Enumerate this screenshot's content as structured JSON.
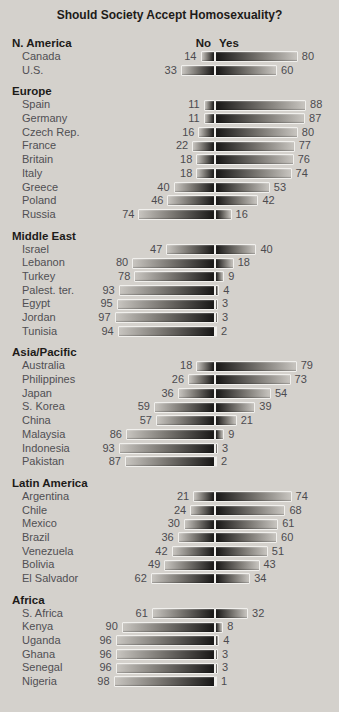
{
  "title": "Should Society Accept Homosexuality?",
  "columns": {
    "no": "No",
    "yes": "Yes"
  },
  "colors": {
    "background": "#d4d1cc",
    "bar_dark": "#181716",
    "bar_mid": "#7a7772",
    "bar_light": "#c8c5c0",
    "bar_border": "#f1f0ed",
    "heading_text": "#1d1b19",
    "label_text": "#504f53"
  },
  "chart_data": {
    "type": "bar",
    "subtype": "diverging-horizontal-paired",
    "title": "Should Society Accept Homosexuality?",
    "unit": "percent",
    "legend": [
      "No",
      "Yes"
    ],
    "legend_position": "top-center",
    "value_range": [
      0,
      100
    ],
    "grid": false,
    "groups": [
      {
        "region": "N. America",
        "rows": [
          {
            "country": "Canada",
            "no": 14,
            "yes": 80
          },
          {
            "country": "U.S.",
            "no": 33,
            "yes": 60
          }
        ]
      },
      {
        "region": "Europe",
        "rows": [
          {
            "country": "Spain",
            "no": 11,
            "yes": 88
          },
          {
            "country": "Germany",
            "no": 11,
            "yes": 87
          },
          {
            "country": "Czech Rep.",
            "no": 16,
            "yes": 80
          },
          {
            "country": "France",
            "no": 22,
            "yes": 77
          },
          {
            "country": "Britain",
            "no": 18,
            "yes": 76
          },
          {
            "country": "Italy",
            "no": 18,
            "yes": 74
          },
          {
            "country": "Greece",
            "no": 40,
            "yes": 53
          },
          {
            "country": "Poland",
            "no": 46,
            "yes": 42
          },
          {
            "country": "Russia",
            "no": 74,
            "yes": 16
          }
        ]
      },
      {
        "region": "Middle East",
        "rows": [
          {
            "country": "Israel",
            "no": 47,
            "yes": 40
          },
          {
            "country": "Lebanon",
            "no": 80,
            "yes": 18
          },
          {
            "country": "Turkey",
            "no": 78,
            "yes": 9
          },
          {
            "country": "Palest. ter.",
            "no": 93,
            "yes": 4
          },
          {
            "country": "Egypt",
            "no": 95,
            "yes": 3
          },
          {
            "country": "Jordan",
            "no": 97,
            "yes": 3
          },
          {
            "country": "Tunisia",
            "no": 94,
            "yes": 2
          }
        ]
      },
      {
        "region": "Asia/Pacific",
        "rows": [
          {
            "country": "Australia",
            "no": 18,
            "yes": 79
          },
          {
            "country": "Philippines",
            "no": 26,
            "yes": 73
          },
          {
            "country": "Japan",
            "no": 36,
            "yes": 54
          },
          {
            "country": "S. Korea",
            "no": 59,
            "yes": 39
          },
          {
            "country": "China",
            "no": 57,
            "yes": 21
          },
          {
            "country": "Malaysia",
            "no": 86,
            "yes": 9
          },
          {
            "country": "Indonesia",
            "no": 93,
            "yes": 3
          },
          {
            "country": "Pakistan",
            "no": 87,
            "yes": 2
          }
        ]
      },
      {
        "region": "Latin America",
        "rows": [
          {
            "country": "Argentina",
            "no": 21,
            "yes": 74
          },
          {
            "country": "Chile",
            "no": 24,
            "yes": 68
          },
          {
            "country": "Mexico",
            "no": 30,
            "yes": 61
          },
          {
            "country": "Brazil",
            "no": 36,
            "yes": 60
          },
          {
            "country": "Venezuela",
            "no": 42,
            "yes": 51
          },
          {
            "country": "Bolivia",
            "no": 49,
            "yes": 43
          },
          {
            "country": "El Salvador",
            "no": 62,
            "yes": 34
          }
        ]
      },
      {
        "region": "Africa",
        "rows": [
          {
            "country": "S. Africa",
            "no": 61,
            "yes": 32
          },
          {
            "country": "Kenya",
            "no": 90,
            "yes": 8
          },
          {
            "country": "Uganda",
            "no": 96,
            "yes": 4
          },
          {
            "country": "Ghana",
            "no": 96,
            "yes": 3
          },
          {
            "country": "Senegal",
            "no": 96,
            "yes": 3
          },
          {
            "country": "Nigeria",
            "no": 98,
            "yes": 1
          }
        ]
      }
    ]
  }
}
